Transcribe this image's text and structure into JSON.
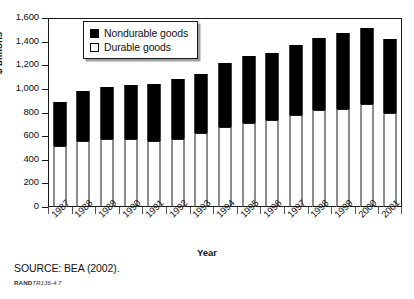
{
  "chart_data": {
    "type": "bar",
    "subtype": "stacked-vertical",
    "title": "",
    "xlabel": "Year",
    "ylabel": "$ billions",
    "ylim": [
      0,
      1600
    ],
    "ytick_step": 200,
    "yticks": [
      "0",
      "200",
      "400",
      "600",
      "800",
      "1,000",
      "1,200",
      "1,400",
      "1,600"
    ],
    "grid": false,
    "legend_position": "top-left-inside",
    "categories": [
      "1987",
      "1988",
      "1989",
      "1990",
      "1991",
      "1992",
      "1993",
      "1994",
      "1995",
      "1996",
      "1997",
      "1998",
      "1999",
      "2000",
      "2001"
    ],
    "series": [
      {
        "name": "Durable goods",
        "color": "#ffffff",
        "values": [
          515,
          560,
          575,
          575,
          560,
          580,
          625,
          680,
          715,
          735,
          775,
          820,
          830,
          870,
          800
        ]
      },
      {
        "name": "Nondurable goods",
        "color": "#000000",
        "values": [
          375,
          420,
          440,
          455,
          480,
          500,
          505,
          540,
          565,
          570,
          595,
          610,
          640,
          645,
          620
        ]
      }
    ],
    "totals": [
      890,
      980,
      1015,
      1030,
      1040,
      1080,
      1130,
      1220,
      1280,
      1305,
      1370,
      1430,
      1470,
      1515,
      1420
    ]
  },
  "legend": {
    "items": [
      {
        "label": "Nondurable goods",
        "swatch": "black"
      },
      {
        "label": "Durable goods",
        "swatch": "white"
      }
    ]
  },
  "axes": {
    "y_title": "$ billions",
    "x_title": "Year"
  },
  "footer": {
    "source": "SOURCE: BEA (2002).",
    "figure_id_prefix": "RAND",
    "figure_id_number": "TR136-4.7"
  }
}
